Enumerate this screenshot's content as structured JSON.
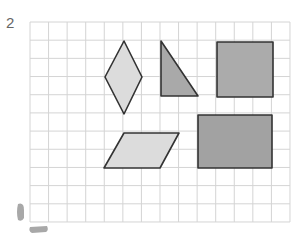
{
  "exercise": {
    "number": "2"
  },
  "grid": {
    "x0": 30,
    "y0": 22,
    "cols": 14,
    "rows": 11,
    "cell_w": 18.57,
    "cell_h": 18.18,
    "line_color": "#d4d4d4"
  },
  "shapes": [
    {
      "name": "rhombus",
      "fill": "#dcdcdc",
      "points": "124,41 142,77 124,114 105,77"
    },
    {
      "name": "right-triangle",
      "fill": "#a9a9a9",
      "points": "161,41 198,96 161,96"
    },
    {
      "name": "square",
      "fill": "#ababab",
      "points": "217,42 273,42 273,97 217,97"
    },
    {
      "name": "parallelogram",
      "fill": "#dcdcdc",
      "points": "124,133 179,133 160,168 104,168"
    },
    {
      "name": "rectangle",
      "fill": "#a2a2a2",
      "points": "198,115 272,115 272,168 198,168"
    }
  ],
  "colors": {
    "outline": "#333333",
    "marks": "#a8a8a8"
  }
}
